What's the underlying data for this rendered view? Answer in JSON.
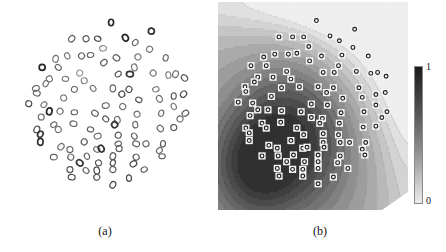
{
  "figure": {
    "panels": [
      {
        "id": "a",
        "caption": "(a)",
        "type": "scatter"
      },
      {
        "id": "b",
        "caption": "(b)",
        "type": "contour-with-scatter"
      }
    ]
  },
  "colorbar": {
    "max_label": "1",
    "min_label": "0",
    "orientation": "vertical",
    "dark_end": "top",
    "color_high": "#1b1b1b",
    "color_low": "#ececec"
  },
  "chart_data": {
    "type": "scatter",
    "title": "",
    "xlabel": "",
    "ylabel": "",
    "xlim": [
      0,
      1
    ],
    "ylim": [
      0,
      1
    ],
    "grid": false,
    "legend": null,
    "marker_shape": "circle-outline",
    "panel_a": {
      "caption": "(a)",
      "description": "Scatter of ring markers on white background, roughly circular spatial support, marker gray level varies",
      "n_points": 104,
      "points": [
        [
          0.52,
          0.055,
          0.12
        ],
        [
          0.3,
          0.14,
          0.45
        ],
        [
          0.38,
          0.14,
          0.4
        ],
        [
          0.445,
          0.14,
          0.28
        ],
        [
          0.6,
          0.135,
          0.1
        ],
        [
          0.745,
          0.1,
          0.18
        ],
        [
          0.655,
          0.16,
          0.52
        ],
        [
          0.475,
          0.19,
          0.72
        ],
        [
          0.735,
          0.195,
          0.55
        ],
        [
          0.275,
          0.23,
          0.6
        ],
        [
          0.21,
          0.245,
          0.58
        ],
        [
          0.355,
          0.23,
          0.48
        ],
        [
          0.405,
          0.225,
          0.5
        ],
        [
          0.55,
          0.24,
          0.42
        ],
        [
          0.67,
          0.235,
          0.58
        ],
        [
          0.825,
          0.24,
          0.5
        ],
        [
          0.48,
          0.265,
          0.45
        ],
        [
          0.135,
          0.29,
          0.1
        ],
        [
          0.225,
          0.29,
          0.52
        ],
        [
          0.65,
          0.29,
          0.55
        ],
        [
          0.345,
          0.32,
          0.74
        ],
        [
          0.56,
          0.325,
          0.42
        ],
        [
          0.625,
          0.325,
          0.22
        ],
        [
          0.755,
          0.32,
          0.6
        ],
        [
          0.84,
          0.33,
          0.68
        ],
        [
          0.88,
          0.325,
          0.5
        ],
        [
          0.175,
          0.35,
          0.55
        ],
        [
          0.265,
          0.35,
          0.62
        ],
        [
          0.93,
          0.345,
          0.35
        ],
        [
          0.37,
          0.36,
          0.65
        ],
        [
          0.155,
          0.375,
          0.58
        ],
        [
          0.1,
          0.4,
          0.52
        ],
        [
          0.315,
          0.405,
          0.52
        ],
        [
          0.42,
          0.4,
          0.58
        ],
        [
          0.53,
          0.4,
          0.48
        ],
        [
          0.62,
          0.405,
          0.35
        ],
        [
          0.77,
          0.405,
          0.62
        ],
        [
          0.105,
          0.425,
          0.48
        ],
        [
          0.58,
          0.43,
          0.25
        ],
        [
          0.87,
          0.44,
          0.4
        ],
        [
          0.925,
          0.43,
          0.25
        ],
        [
          0.255,
          0.45,
          0.6
        ],
        [
          0.675,
          0.46,
          0.4
        ],
        [
          0.79,
          0.455,
          0.55
        ],
        [
          0.06,
          0.48,
          0.3
        ],
        [
          0.145,
          0.485,
          0.6
        ],
        [
          0.49,
          0.49,
          0.52
        ],
        [
          0.585,
          0.495,
          0.55
        ],
        [
          0.87,
          0.495,
          0.62
        ],
        [
          0.175,
          0.52,
          0.12
        ],
        [
          0.235,
          0.52,
          0.58
        ],
        [
          0.315,
          0.525,
          0.48
        ],
        [
          0.43,
          0.53,
          0.5
        ],
        [
          0.665,
          0.535,
          0.55
        ],
        [
          0.8,
          0.53,
          0.5
        ],
        [
          0.935,
          0.53,
          0.45
        ],
        [
          0.13,
          0.55,
          0.55
        ],
        [
          0.49,
          0.56,
          0.42
        ],
        [
          0.555,
          0.565,
          0.52
        ],
        [
          0.905,
          0.56,
          0.5
        ],
        [
          0.2,
          0.59,
          0.52
        ],
        [
          0.31,
          0.585,
          0.48
        ],
        [
          0.54,
          0.59,
          0.18
        ],
        [
          0.655,
          0.59,
          0.5
        ],
        [
          0.105,
          0.615,
          0.25
        ],
        [
          0.225,
          0.615,
          0.55
        ],
        [
          0.405,
          0.615,
          0.48
        ],
        [
          0.795,
          0.61,
          0.48
        ],
        [
          0.87,
          0.605,
          0.42
        ],
        [
          0.125,
          0.64,
          0.22
        ],
        [
          0.445,
          0.65,
          0.5
        ],
        [
          0.56,
          0.645,
          0.35
        ],
        [
          0.65,
          0.65,
          0.5
        ],
        [
          0.125,
          0.68,
          0.2
        ],
        [
          0.37,
          0.68,
          0.45
        ],
        [
          0.56,
          0.69,
          0.52
        ],
        [
          0.66,
          0.69,
          0.4
        ],
        [
          0.715,
          0.69,
          0.5
        ],
        [
          0.81,
          0.69,
          0.4
        ],
        [
          0.24,
          0.705,
          0.5
        ],
        [
          0.29,
          0.72,
          0.48
        ],
        [
          0.44,
          0.72,
          0.55
        ],
        [
          0.465,
          0.715,
          0.18
        ],
        [
          0.565,
          0.715,
          0.4
        ],
        [
          0.79,
          0.725,
          0.5
        ],
        [
          0.2,
          0.76,
          0.5
        ],
        [
          0.295,
          0.76,
          0.48
        ],
        [
          0.385,
          0.755,
          0.45
        ],
        [
          0.53,
          0.755,
          0.4
        ],
        [
          0.66,
          0.76,
          0.45
        ],
        [
          0.805,
          0.755,
          0.45
        ],
        [
          0.345,
          0.79,
          0.22
        ],
        [
          0.45,
          0.79,
          0.38
        ],
        [
          0.53,
          0.79,
          0.35
        ],
        [
          0.645,
          0.795,
          0.25
        ],
        [
          0.29,
          0.825,
          0.4
        ],
        [
          0.38,
          0.83,
          0.48
        ],
        [
          0.44,
          0.83,
          0.28
        ],
        [
          0.53,
          0.825,
          0.42
        ],
        [
          0.705,
          0.825,
          0.42
        ],
        [
          0.3,
          0.865,
          0.35
        ],
        [
          0.44,
          0.865,
          0.45
        ],
        [
          0.62,
          0.87,
          0.3
        ],
        [
          0.53,
          0.905,
          0.25
        ]
      ]
    },
    "panel_b": {
      "caption": "(b)",
      "description": "Same point set as panel (a), drawn as circles with white square halos, overlaid on a grayscale contour/density field. Dark (high, value 1) in the centre and lower-left, light (low, value 0) toward the upper-right corner and outer margins.",
      "field_range": [
        0,
        1
      ],
      "field_dark_region": "center-and-lower-left",
      "field_light_region": "upper-right-corner",
      "contour_lines": true
    }
  }
}
